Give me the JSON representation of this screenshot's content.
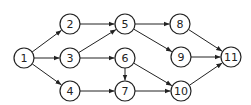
{
  "diagram": {
    "type": "directed-network",
    "nodes": [
      {
        "id": "1",
        "label": "1",
        "x": 24,
        "y": 58
      },
      {
        "id": "2",
        "label": "2",
        "x": 70,
        "y": 24
      },
      {
        "id": "3",
        "label": "3",
        "x": 70,
        "y": 58
      },
      {
        "id": "4",
        "label": "4",
        "x": 70,
        "y": 91
      },
      {
        "id": "5",
        "label": "5",
        "x": 125,
        "y": 24
      },
      {
        "id": "6",
        "label": "6",
        "x": 125,
        "y": 58
      },
      {
        "id": "7",
        "label": "7",
        "x": 125,
        "y": 91
      },
      {
        "id": "8",
        "label": "8",
        "x": 180,
        "y": 24
      },
      {
        "id": "9",
        "label": "9",
        "x": 181,
        "y": 57
      },
      {
        "id": "10",
        "label": "10",
        "x": 181,
        "y": 91
      },
      {
        "id": "11",
        "label": "11",
        "x": 231,
        "y": 57
      }
    ],
    "edges": [
      [
        "1",
        "2"
      ],
      [
        "1",
        "3"
      ],
      [
        "1",
        "4"
      ],
      [
        "2",
        "5"
      ],
      [
        "3",
        "5"
      ],
      [
        "3",
        "6"
      ],
      [
        "4",
        "7"
      ],
      [
        "5",
        "8"
      ],
      [
        "5",
        "9"
      ],
      [
        "6",
        "7"
      ],
      [
        "6",
        "10"
      ],
      [
        "7",
        "10"
      ],
      [
        "8",
        "11"
      ],
      [
        "9",
        "11"
      ],
      [
        "10",
        "11"
      ]
    ],
    "node_radius": 10,
    "colors": {
      "stroke": "#222222",
      "fill": "#ffffff"
    }
  }
}
